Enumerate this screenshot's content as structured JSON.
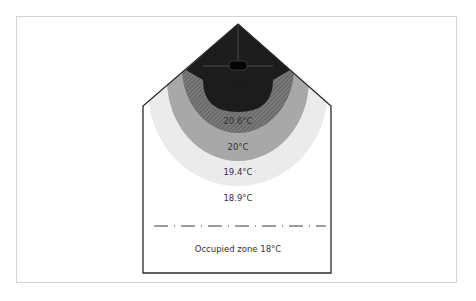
{
  "diagram": {
    "zones": [
      {
        "id": "zone-21",
        "label": "21°C",
        "color": "#1c1c1c"
      },
      {
        "id": "zone-20-6",
        "label": "20.6°C",
        "color": "#6e6e6e",
        "pattern": "diagonal-hatch"
      },
      {
        "id": "zone-20",
        "label": "20°C",
        "color": "#a8a8a8"
      },
      {
        "id": "zone-19-4",
        "label": "19.4°C",
        "color": "#ebebeb"
      },
      {
        "id": "zone-18-9",
        "label": "18.9°C",
        "color": "#ffffff"
      }
    ],
    "occupied_zone": {
      "label": "Occupied zone 18°C",
      "line_style": "dash-dot"
    },
    "colors": {
      "outline": "#2a2a2a",
      "frame": "#d4d4d4",
      "text": "#333333"
    }
  }
}
